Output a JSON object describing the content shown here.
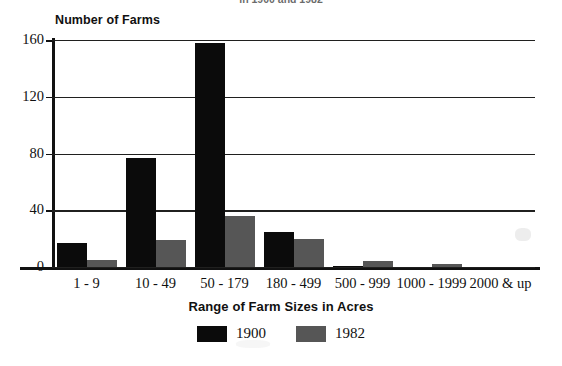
{
  "chart_data": {
    "type": "bar",
    "title": "in 1900 and 1982",
    "ylabel": "Number of Farms",
    "xlabel": "Range of Farm Sizes in Acres",
    "categories": [
      "1 - 9",
      "10 - 49",
      "50 - 179",
      "180 - 499",
      "500 - 999",
      "1000 - 1999",
      "2000 & up"
    ],
    "series": [
      {
        "name": "1900",
        "color": "#0b0b0b",
        "values": [
          17,
          77,
          158,
          25,
          1,
          0,
          0
        ]
      },
      {
        "name": "1982",
        "color": "#565656",
        "values": [
          5,
          19,
          36,
          20,
          4,
          2,
          0
        ]
      }
    ],
    "ylim": [
      0,
      160
    ],
    "yticks": [
      0,
      40,
      80,
      120,
      160
    ],
    "ytick_labels": [
      "0",
      "40",
      "80",
      "120",
      "160"
    ],
    "grid": true,
    "legend_position": "bottom"
  }
}
